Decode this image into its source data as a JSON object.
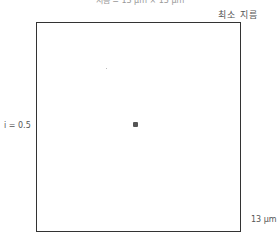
{
  "top_caption": "지름 = 13 μm × 13 μm",
  "corner_label": "최소 지름",
  "left_label": "i = 0.5",
  "scale_label": "13 μm",
  "colors": {
    "frame": "#333333",
    "dot": "#555555",
    "background": "#ffffff"
  }
}
